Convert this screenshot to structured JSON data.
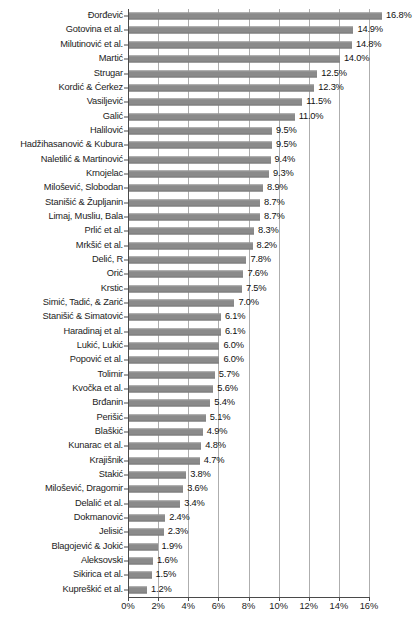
{
  "chart_data": {
    "type": "bar",
    "orientation": "horizontal",
    "title": "",
    "subtitle": "",
    "xlabel": "",
    "ylabel": "",
    "xlim": [
      0,
      16
    ],
    "xtick_labels": [
      "0%",
      "2%",
      "4%",
      "6%",
      "8%",
      "10%",
      "12%",
      "14%",
      "16%"
    ],
    "xtick_values": [
      0,
      2,
      4,
      6,
      8,
      10,
      12,
      14,
      16
    ],
    "grid": "vertical",
    "legend": "none",
    "bar_color": "#8a8a8a",
    "axis_color": "#4a4a4a",
    "gridline_color": "#aeaeae",
    "categories": [
      "Đorđević",
      "Gotovina et al.",
      "Milutinović et al.",
      "Martić",
      "Strugar",
      "Kordić & Ćerkez",
      "Vasiljević",
      "Galić",
      "Halilović",
      "Hadžihasanović & Kubura",
      "Naletilić & Martinović",
      "Krnojelac",
      "Milošević, Slobodan",
      "Stanišić & Župljanin",
      "Limaj, Musliu, Bala",
      "Prlić et al.",
      "Mrkšić et al.",
      "Delić, R",
      "Orić",
      "Krstic",
      "Simić, Tadić, & Zarić",
      "Stanišić & Simatović",
      "Haradinaj et al.",
      "Lukić, Lukić",
      "Popović et al.",
      "Tolimir",
      "Kvočka et al.",
      "Brđanin",
      "Perišić",
      "Blaškić",
      "Kunarac et al.",
      "Krajišnik",
      "Stakić",
      "Milošević, Dragomir",
      "Delalić et al.",
      "Dokmanović",
      "Jelisić",
      "Blagojević & Jokić",
      "Aleksovski",
      "Sikirica et al.",
      "Kupreškić et al."
    ],
    "values": [
      16.8,
      14.9,
      14.8,
      14.0,
      12.5,
      12.3,
      11.5,
      11.0,
      9.5,
      9.5,
      9.4,
      9.3,
      8.9,
      8.7,
      8.7,
      8.3,
      8.2,
      7.8,
      7.6,
      7.5,
      7.0,
      6.1,
      6.1,
      6.0,
      6.0,
      5.7,
      5.6,
      5.4,
      5.1,
      4.9,
      4.8,
      4.7,
      3.8,
      3.6,
      3.4,
      2.4,
      2.3,
      1.9,
      1.6,
      1.5,
      1.2
    ],
    "value_labels": [
      "16.8%",
      "14.9%",
      "14.8%",
      "14.0%",
      "12.5%",
      "12.3%",
      "11.5%",
      "11.0%",
      "9.5%",
      "9.5%",
      "9.4%",
      "9.3%",
      "8.9%",
      "8.7%",
      "8.7%",
      "8.3%",
      "8.2%",
      "7.8%",
      "7.6%",
      "7.5%",
      "7.0%",
      "6.1%",
      "6.1%",
      "6.0%",
      "6.0%",
      "5.7%",
      "5.6%",
      "5.4%",
      "5.1%",
      "4.9%",
      "4.8%",
      "4.7%",
      "3.8%",
      "3.6%",
      "3.4%",
      "2.4%",
      "2.3%",
      "1.9%",
      "1.6%",
      "1.5%",
      "1.2%"
    ]
  }
}
